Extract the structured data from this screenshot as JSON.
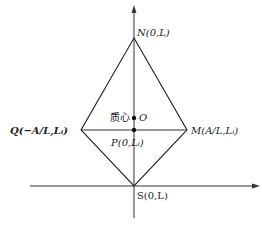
{
  "diagram": {
    "type": "kite/rhombus geometry on coordinate axes",
    "points": {
      "N": {
        "label": "N(0,L)",
        "x": 134,
        "y": 38
      },
      "M": {
        "label": "M(A/L,Lᵢ)",
        "x": 187,
        "y": 130
      },
      "Q": {
        "label": "Q(−A/L,Lᵢ)",
        "x": 81,
        "y": 130
      },
      "S": {
        "label": "S(0,L)",
        "x": 134,
        "y": 186
      },
      "P": {
        "label": "P(0,Lᵢ)",
        "x": 134,
        "y": 130
      },
      "O": {
        "label": "O",
        "x": 134,
        "y": 118
      }
    },
    "centroid_label": "质心",
    "colors": {
      "line": "#222222",
      "background": "#ffffff"
    }
  },
  "labels": {
    "N": "N(0,L)",
    "M": "M(A/L,Lᵢ)",
    "Q": "Q(−A/L,Lᵢ)",
    "S": "S(0,L)",
    "P": "P(0,Lᵢ)",
    "O": "O",
    "centroid": "质心"
  }
}
